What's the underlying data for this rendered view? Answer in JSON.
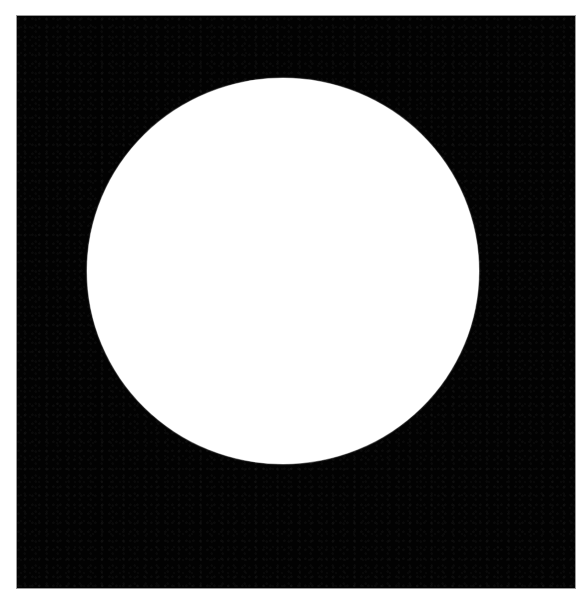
{
  "figure": {
    "background_color": "#ffffff",
    "square": {
      "color": "#020202",
      "x": 17,
      "y": 16,
      "width": 558,
      "height": 572
    },
    "circle": {
      "color": "#ffffff",
      "center_x": 283,
      "center_y": 271,
      "radius_x": 196,
      "radius_y": 193
    }
  }
}
